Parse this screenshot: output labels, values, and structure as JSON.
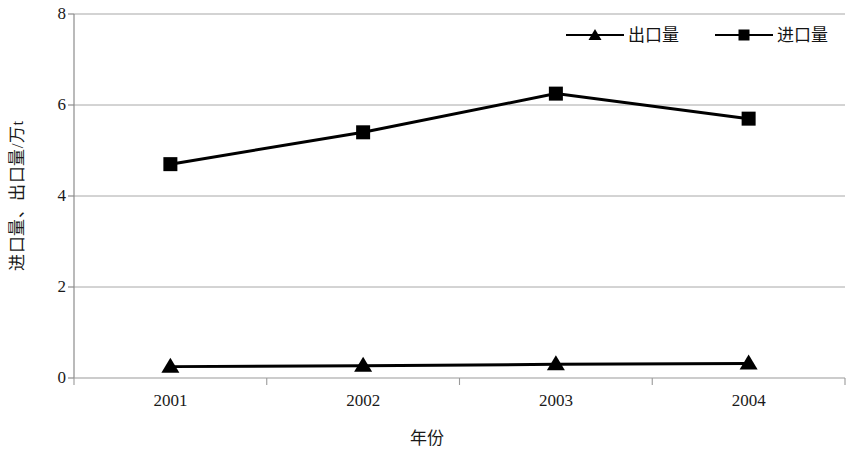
{
  "chart_data": {
    "type": "line",
    "title": "",
    "xlabel": "年份",
    "ylabel": "进口量、出口量/万t",
    "categories": [
      "2001",
      "2002",
      "2003",
      "2004"
    ],
    "ylim": [
      0,
      8
    ],
    "yticks": [
      0,
      2,
      4,
      6,
      8
    ],
    "grid": true,
    "legend_position": "top-right",
    "series": [
      {
        "name": "出口量",
        "marker": "triangle",
        "color": "#000000",
        "values": [
          0.25,
          0.27,
          0.3,
          0.32
        ]
      },
      {
        "name": "进口量",
        "marker": "square",
        "color": "#000000",
        "values": [
          4.7,
          5.4,
          6.25,
          5.7
        ]
      }
    ]
  },
  "axis": {
    "y_title": "进口量、出口量/万t",
    "x_title": "年份",
    "y_tick_labels": [
      "8",
      "6",
      "4",
      "2",
      "0"
    ],
    "x_tick_labels": [
      "2001",
      "2002",
      "2003",
      "2004"
    ]
  },
  "legend": {
    "items": [
      {
        "label": "出口量",
        "marker": "triangle-marker-icon"
      },
      {
        "label": "进口量",
        "marker": "square-marker-icon"
      }
    ]
  },
  "colors": {
    "line": "#000000",
    "grid": "#a8a8a8",
    "axis": "#8c8c8c",
    "text": "#1a1a1a",
    "background": "#ffffff"
  }
}
